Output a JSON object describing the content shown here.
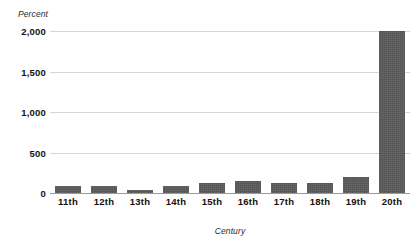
{
  "chart_data": {
    "type": "bar",
    "title": "",
    "subtitle": "",
    "xlabel": "Century",
    "ylabel": "Percent",
    "categories": [
      "11th",
      "12th",
      "13th",
      "14th",
      "15th",
      "16th",
      "17th",
      "18th",
      "19th",
      "20th"
    ],
    "values": [
      90,
      90,
      40,
      90,
      120,
      150,
      120,
      120,
      200,
      2000
    ],
    "series": [
      {
        "name": "Percent",
        "values": [
          90,
          90,
          40,
          90,
          120,
          150,
          120,
          120,
          200,
          2000
        ]
      }
    ],
    "ylim": [
      0,
      2000
    ],
    "ytick_values": [
      0,
      500,
      1000,
      1500,
      2000
    ],
    "ytick_labels": [
      "0",
      "500",
      "1,000",
      "1,500",
      "2,000"
    ],
    "grid": true,
    "grid_axis": "y",
    "legend": false,
    "legend_position": "none",
    "bar_color": "#555555",
    "gridline_color": "#d6d6d6",
    "axis_color": "#9a9a9a",
    "background_color": "#ffffff",
    "annotations": []
  }
}
